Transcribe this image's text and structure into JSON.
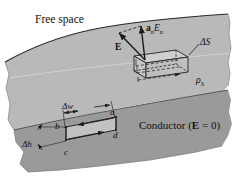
{
  "figure": {
    "title_region_free_space": "Free space",
    "conductor_label_text": "Conductor (",
    "conductor_label_field": "E",
    "conductor_label_tail": " = 0)",
    "surface_charge": "ρ",
    "surface_charge_sub": "S",
    "pillbox_label": "ΔS",
    "normal_field_vector_bold": "a",
    "normal_field_vector_sub": "n",
    "normal_field_vector_mag": "E",
    "normal_field_vector_mag_sub": "n",
    "field_vector": "E",
    "width_label": "Δw",
    "height_label": "Δh",
    "corner_a": "a",
    "corner_b": "b",
    "corner_c": "c",
    "corner_d": "d"
  },
  "colors": {
    "free_space_bg": "#ffffff",
    "dielectric_fill": "#b9b9b9",
    "conductor_fill": "#9a9a9a",
    "line": "#1a1a1a",
    "pillbox_fill": "#c6c6c6",
    "loop_fill": "#c2c2c2"
  }
}
